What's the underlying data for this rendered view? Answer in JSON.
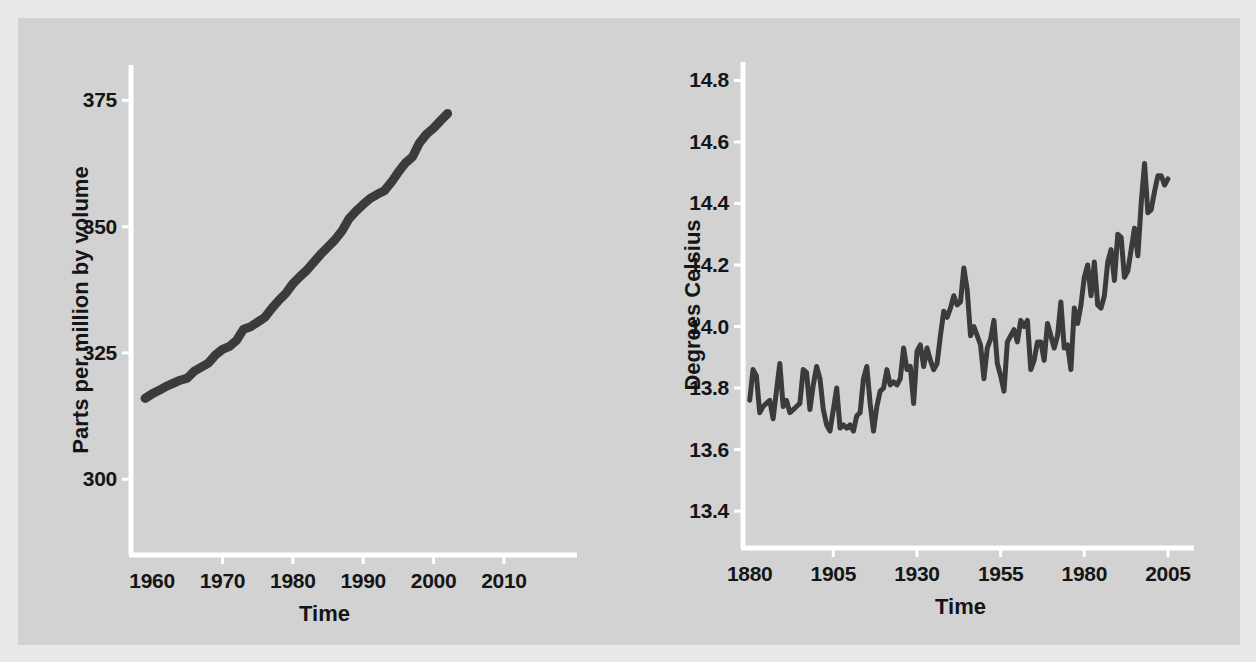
{
  "figure": {
    "background_color": "#d2d2d3",
    "line_color": "#3b3b3b",
    "axis_color": "#ffffff",
    "text_color": "#151515"
  },
  "chart_data": [
    {
      "id": "co2",
      "type": "line",
      "title": "",
      "xlabel": "Time",
      "ylabel": "Parts per million by volume",
      "xlim": [
        1957,
        2012
      ],
      "ylim": [
        285,
        382
      ],
      "xticks": [
        "1960",
        "1970",
        "1980",
        "1990",
        "2000",
        "2010"
      ],
      "xtick_values": [
        1960,
        1970,
        1980,
        1990,
        2000,
        2010
      ],
      "yticks": [
        "300",
        "325",
        "350",
        "375"
      ],
      "ytick_values": [
        300,
        325,
        350,
        375
      ],
      "grid": false,
      "legend": "none",
      "x": [
        1959,
        1960,
        1961,
        1962,
        1963,
        1964,
        1965,
        1966,
        1967,
        1968,
        1969,
        1970,
        1971,
        1972,
        1973,
        1974,
        1975,
        1976,
        1977,
        1978,
        1979,
        1980,
        1981,
        1982,
        1983,
        1984,
        1985,
        1986,
        1987,
        1988,
        1989,
        1990,
        1991,
        1992,
        1993,
        1994,
        1995,
        1996,
        1997,
        1998,
        1999,
        2000,
        2001,
        2002
      ],
      "values": [
        316.0,
        316.9,
        317.6,
        318.4,
        319.0,
        319.6,
        320.0,
        321.4,
        322.2,
        323.0,
        324.6,
        325.7,
        326.3,
        327.5,
        329.7,
        330.2,
        331.1,
        332.0,
        333.8,
        335.4,
        336.8,
        338.7,
        340.1,
        341.4,
        343.0,
        344.6,
        346.0,
        347.4,
        349.2,
        351.6,
        353.1,
        354.4,
        355.6,
        356.4,
        357.1,
        358.8,
        360.8,
        362.6,
        363.8,
        366.6,
        368.3,
        369.5,
        371.0,
        372.4
      ]
    },
    {
      "id": "temperature",
      "type": "line",
      "title": "",
      "xlabel": "Time",
      "ylabel": "Degrees Celsius",
      "xlim": [
        1878,
        2008
      ],
      "ylim": [
        13.28,
        14.86
      ],
      "xticks": [
        "1880",
        "1905",
        "1930",
        "1955",
        "1980",
        "2005"
      ],
      "xtick_values": [
        1880,
        1905,
        1930,
        1955,
        1980,
        2005
      ],
      "yticks": [
        "13.4",
        "13.6",
        "13.8",
        "14.0",
        "14.2",
        "14.4",
        "14.6",
        "14.8"
      ],
      "ytick_values": [
        13.4,
        13.6,
        13.8,
        14.0,
        14.2,
        14.4,
        14.6,
        14.8
      ],
      "grid": false,
      "legend": "none",
      "x": [
        1880,
        1881,
        1882,
        1883,
        1884,
        1885,
        1886,
        1887,
        1888,
        1889,
        1890,
        1891,
        1892,
        1893,
        1894,
        1895,
        1896,
        1897,
        1898,
        1899,
        1900,
        1901,
        1902,
        1903,
        1904,
        1905,
        1906,
        1907,
        1908,
        1909,
        1910,
        1911,
        1912,
        1913,
        1914,
        1915,
        1916,
        1917,
        1918,
        1919,
        1920,
        1921,
        1922,
        1923,
        1924,
        1925,
        1926,
        1927,
        1928,
        1929,
        1930,
        1931,
        1932,
        1933,
        1934,
        1935,
        1936,
        1937,
        1938,
        1939,
        1940,
        1941,
        1942,
        1943,
        1944,
        1945,
        1946,
        1947,
        1948,
        1949,
        1950,
        1951,
        1952,
        1953,
        1954,
        1955,
        1956,
        1957,
        1958,
        1959,
        1960,
        1961,
        1962,
        1963,
        1964,
        1965,
        1966,
        1967,
        1968,
        1969,
        1970,
        1971,
        1972,
        1973,
        1974,
        1975,
        1976,
        1977,
        1978,
        1979,
        1980,
        1981,
        1982,
        1983,
        1984,
        1985,
        1986,
        1987,
        1988,
        1989,
        1990,
        1991,
        1992,
        1993,
        1994,
        1995,
        1996,
        1997,
        1998,
        1999,
        2000,
        2001,
        2002,
        2003,
        2004,
        2005
      ],
      "values": [
        13.76,
        13.86,
        13.84,
        13.72,
        13.74,
        13.75,
        13.76,
        13.7,
        13.79,
        13.88,
        13.74,
        13.76,
        13.72,
        13.73,
        13.74,
        13.75,
        13.86,
        13.85,
        13.73,
        13.81,
        13.87,
        13.83,
        13.73,
        13.68,
        13.66,
        13.73,
        13.8,
        13.67,
        13.68,
        13.67,
        13.68,
        13.66,
        13.71,
        13.72,
        13.83,
        13.87,
        13.75,
        13.66,
        13.74,
        13.79,
        13.8,
        13.86,
        13.81,
        13.82,
        13.81,
        13.83,
        13.93,
        13.86,
        13.87,
        13.75,
        13.92,
        13.94,
        13.87,
        13.93,
        13.89,
        13.86,
        13.88,
        13.97,
        14.05,
        14.03,
        14.06,
        14.1,
        14.07,
        14.08,
        14.19,
        14.12,
        13.97,
        14.0,
        13.97,
        13.94,
        13.83,
        13.93,
        13.96,
        14.02,
        13.88,
        13.84,
        13.79,
        13.95,
        13.97,
        13.99,
        13.95,
        14.02,
        14.0,
        14.02,
        13.86,
        13.89,
        13.95,
        13.95,
        13.89,
        14.01,
        13.97,
        13.93,
        13.97,
        14.08,
        13.93,
        13.94,
        13.86,
        14.06,
        14.01,
        14.07,
        14.16,
        14.2,
        14.1,
        14.21,
        14.07,
        14.06,
        14.1,
        14.21,
        14.25,
        14.15,
        14.3,
        14.29,
        14.16,
        14.18,
        14.25,
        14.32,
        14.23,
        14.4,
        14.53,
        14.37,
        14.38,
        14.44,
        14.49,
        14.49,
        14.46,
        14.48
      ]
    }
  ]
}
